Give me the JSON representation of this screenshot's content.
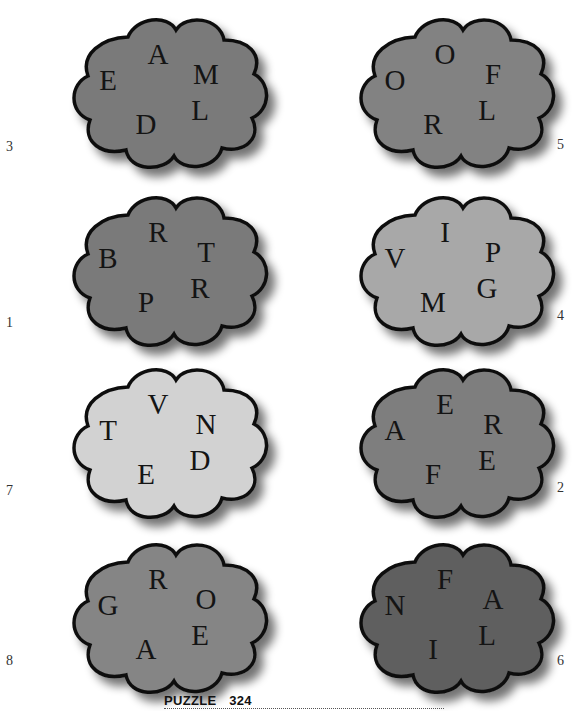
{
  "clouds": [
    {
      "number": "3",
      "fill": "#7a7a7a",
      "letters": [
        "A",
        "E",
        "M",
        "L",
        "D"
      ]
    },
    {
      "number": "5",
      "fill": "#828282",
      "letters": [
        "O",
        "O",
        "F",
        "L",
        "R"
      ]
    },
    {
      "number": "1",
      "fill": "#7a7a7a",
      "letters": [
        "R",
        "B",
        "T",
        "R",
        "P"
      ]
    },
    {
      "number": "4",
      "fill": "#a8a8a8",
      "letters": [
        "I",
        "V",
        "P",
        "G",
        "M"
      ]
    },
    {
      "number": "7",
      "fill": "#d2d2d2",
      "letters": [
        "V",
        "T",
        "N",
        "D",
        "E"
      ]
    },
    {
      "number": "2",
      "fill": "#7e7e7e",
      "letters": [
        "E",
        "A",
        "R",
        "E",
        "F"
      ]
    },
    {
      "number": "8",
      "fill": "#858585",
      "letters": [
        "R",
        "G",
        "O",
        "E",
        "A"
      ]
    },
    {
      "number": "6",
      "fill": "#5e5e5e",
      "letters": [
        "F",
        "N",
        "A",
        "L",
        "I"
      ]
    }
  ],
  "footer": {
    "label": "PUZZLE",
    "number": "324",
    "text": "PUZZLE 324"
  }
}
